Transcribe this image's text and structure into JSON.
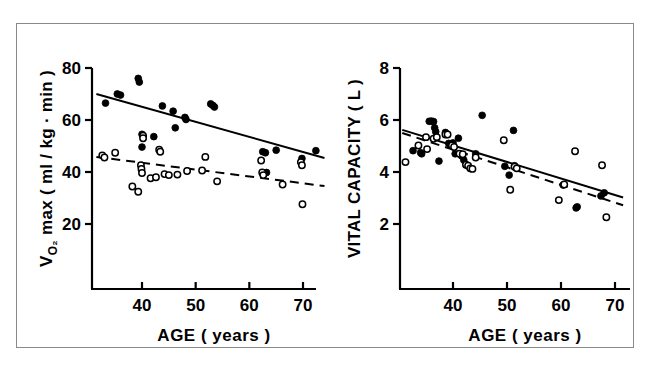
{
  "figure": {
    "frame_color": "#8a8a8a",
    "background": "#ffffff",
    "ink_color": "#000000",
    "panel_count": 2
  },
  "chart_data": [
    {
      "type": "scatter",
      "panel": "left",
      "title": "",
      "xlabel": "AGE  ( years )",
      "ylabel": "V̇O₂ max  ( ml / kg · min )",
      "ylabel_parts": {
        "main": "V",
        "sub": "O₂",
        "rest": " max  ( ml / kg · min )"
      },
      "xlim": [
        30,
        75
      ],
      "ylim": [
        10,
        82
      ],
      "xticks": [
        40,
        50,
        60,
        70
      ],
      "xtick_labels": [
        "40",
        "50",
        "60",
        "70"
      ],
      "yticks": [
        20,
        40,
        60,
        80
      ],
      "ytick_labels": [
        "20",
        "40",
        "60",
        "80"
      ],
      "grid": false,
      "legend": "none",
      "series": [
        {
          "name": "filled",
          "marker": "filled-circle",
          "color": "#000000",
          "points": [
            [
              33.2,
              66.5
            ],
            [
              35.4,
              70.0
            ],
            [
              36.0,
              69.6
            ],
            [
              39.3,
              76.0
            ],
            [
              39.5,
              74.6
            ],
            [
              40.0,
              54.5
            ],
            [
              40.0,
              49.6
            ],
            [
              42.2,
              53.6
            ],
            [
              43.8,
              65.4
            ],
            [
              45.8,
              63.4
            ],
            [
              46.2,
              57.0
            ],
            [
              48.0,
              61.0
            ],
            [
              48.2,
              60.2
            ],
            [
              52.8,
              66.2
            ],
            [
              53.2,
              65.6
            ],
            [
              53.5,
              65.0
            ],
            [
              62.5,
              47.8
            ],
            [
              63.0,
              47.4
            ],
            [
              63.2,
              39.8
            ],
            [
              65.0,
              48.4
            ],
            [
              69.8,
              45.2
            ],
            [
              72.4,
              48.2
            ]
          ]
        },
        {
          "name": "open",
          "marker": "open-circle",
          "color": "#000000",
          "points": [
            [
              32.6,
              46.4
            ],
            [
              33.0,
              45.6
            ],
            [
              35.0,
              47.4
            ],
            [
              38.2,
              34.4
            ],
            [
              39.3,
              32.4
            ],
            [
              39.8,
              42.6
            ],
            [
              39.9,
              41.2
            ],
            [
              40.0,
              39.6
            ],
            [
              40.2,
              54.0
            ],
            [
              40.2,
              53.0
            ],
            [
              41.6,
              37.6
            ],
            [
              42.6,
              38.0
            ],
            [
              43.2,
              48.6
            ],
            [
              43.4,
              47.8
            ],
            [
              44.2,
              39.2
            ],
            [
              45.0,
              38.8
            ],
            [
              46.6,
              39.0
            ],
            [
              48.4,
              40.4
            ],
            [
              51.2,
              40.6
            ],
            [
              51.8,
              45.8
            ],
            [
              54.0,
              36.4
            ],
            [
              62.2,
              44.4
            ],
            [
              62.4,
              39.8
            ],
            [
              62.6,
              38.8
            ],
            [
              66.2,
              35.2
            ],
            [
              69.6,
              43.8
            ],
            [
              69.8,
              42.6
            ],
            [
              69.9,
              27.6
            ]
          ]
        }
      ],
      "fit_lines": [
        {
          "name": "filled-fit",
          "style": "solid",
          "x": [
            31.5,
            74.0
          ],
          "y": [
            70.0,
            45.4
          ]
        },
        {
          "name": "open-fit",
          "style": "dashed",
          "x": [
            31.5,
            74.0
          ],
          "y": [
            45.8,
            34.6
          ]
        }
      ]
    },
    {
      "type": "scatter",
      "panel": "right",
      "title": "",
      "xlabel": "AGE  ( years )",
      "ylabel": "VITAL  CAPACITY  ( L )",
      "xlim": [
        30,
        73
      ],
      "ylim": [
        1.0,
        8.2
      ],
      "xticks": [
        40,
        50,
        60,
        70
      ],
      "xtick_labels": [
        "40",
        "50",
        "60",
        "70"
      ],
      "yticks": [
        2,
        4,
        6,
        8
      ],
      "ytick_labels": [
        "2",
        "4",
        "6",
        "8"
      ],
      "grid": false,
      "legend": "none",
      "series": [
        {
          "name": "filled",
          "marker": "filled-circle",
          "color": "#000000",
          "points": [
            [
              32.6,
              4.82
            ],
            [
              34.0,
              4.74
            ],
            [
              34.2,
              4.7
            ],
            [
              35.6,
              5.95
            ],
            [
              36.0,
              5.96
            ],
            [
              36.4,
              5.94
            ],
            [
              36.6,
              5.7
            ],
            [
              36.8,
              5.55
            ],
            [
              37.4,
              4.42
            ],
            [
              38.6,
              5.52
            ],
            [
              39.2,
              5.1
            ],
            [
              39.6,
              5.06
            ],
            [
              40.0,
              5.12
            ],
            [
              40.4,
              4.7
            ],
            [
              41.0,
              5.3
            ],
            [
              41.6,
              4.62
            ],
            [
              42.0,
              4.46
            ],
            [
              44.2,
              4.7
            ],
            [
              45.4,
              6.18
            ],
            [
              49.6,
              4.22
            ],
            [
              50.4,
              3.88
            ],
            [
              51.2,
              5.6
            ],
            [
              51.4,
              4.24
            ],
            [
              60.4,
              3.5
            ],
            [
              62.8,
              2.62
            ],
            [
              63.0,
              2.66
            ],
            [
              67.4,
              3.08
            ],
            [
              68.0,
              3.2
            ]
          ]
        },
        {
          "name": "open",
          "marker": "open-circle",
          "color": "#000000",
          "points": [
            [
              31.2,
              4.38
            ],
            [
              33.6,
              5.02
            ],
            [
              35.0,
              5.34
            ],
            [
              35.2,
              4.88
            ],
            [
              36.4,
              5.28
            ],
            [
              37.0,
              5.34
            ],
            [
              38.6,
              5.44
            ],
            [
              39.0,
              5.44
            ],
            [
              39.8,
              5.02
            ],
            [
              40.2,
              4.96
            ],
            [
              41.2,
              4.7
            ],
            [
              41.8,
              4.68
            ],
            [
              42.4,
              4.28
            ],
            [
              42.8,
              4.24
            ],
            [
              43.2,
              4.14
            ],
            [
              43.6,
              4.12
            ],
            [
              44.2,
              4.56
            ],
            [
              49.4,
              5.22
            ],
            [
              50.6,
              3.32
            ],
            [
              51.4,
              4.2
            ],
            [
              51.8,
              4.14
            ],
            [
              59.6,
              2.92
            ],
            [
              62.6,
              4.8
            ],
            [
              67.6,
              4.26
            ],
            [
              68.4,
              2.26
            ],
            [
              60.6,
              3.52
            ]
          ]
        }
      ],
      "fit_lines": [
        {
          "name": "filled-fit",
          "style": "solid",
          "x": [
            30.6,
            71.5
          ],
          "y": [
            5.62,
            3.02
          ]
        },
        {
          "name": "open-fit",
          "style": "dashed",
          "x": [
            30.6,
            71.5
          ],
          "y": [
            5.5,
            2.72
          ]
        }
      ]
    }
  ]
}
